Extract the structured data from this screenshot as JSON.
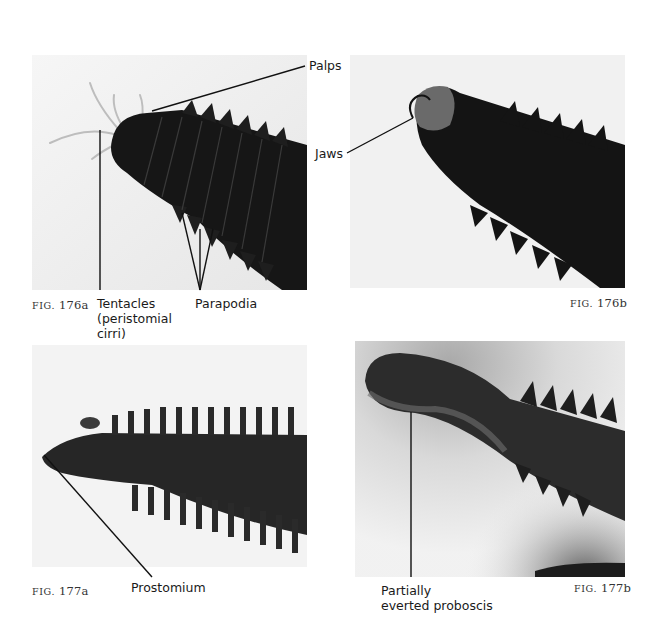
{
  "figures": [
    {
      "id": "176a",
      "caption_prefix": "FIG.",
      "caption_number": "176a",
      "labels": {
        "palps": "Palps",
        "tentacles_line1": "Tentacles",
        "tentacles_line2": "(peristomial",
        "tentacles_line3": "cirri)",
        "parapodia": "Parapodia"
      }
    },
    {
      "id": "176b",
      "caption_prefix": "FIG.",
      "caption_number": "176b",
      "labels": {
        "jaws": "Jaws"
      }
    },
    {
      "id": "177a",
      "caption_prefix": "FIG.",
      "caption_number": "177a",
      "labels": {
        "prostomium": "Prostomium"
      }
    },
    {
      "id": "177b",
      "caption_prefix": "FIG.",
      "caption_number": "177b",
      "labels": {
        "proboscis_line1": "Partially",
        "proboscis_line2": "everted proboscis"
      }
    }
  ],
  "colors": {
    "paper": "#ffffff",
    "photo_background": "#efefef",
    "worm_dark": "#141414",
    "leader_line": "#111111"
  }
}
